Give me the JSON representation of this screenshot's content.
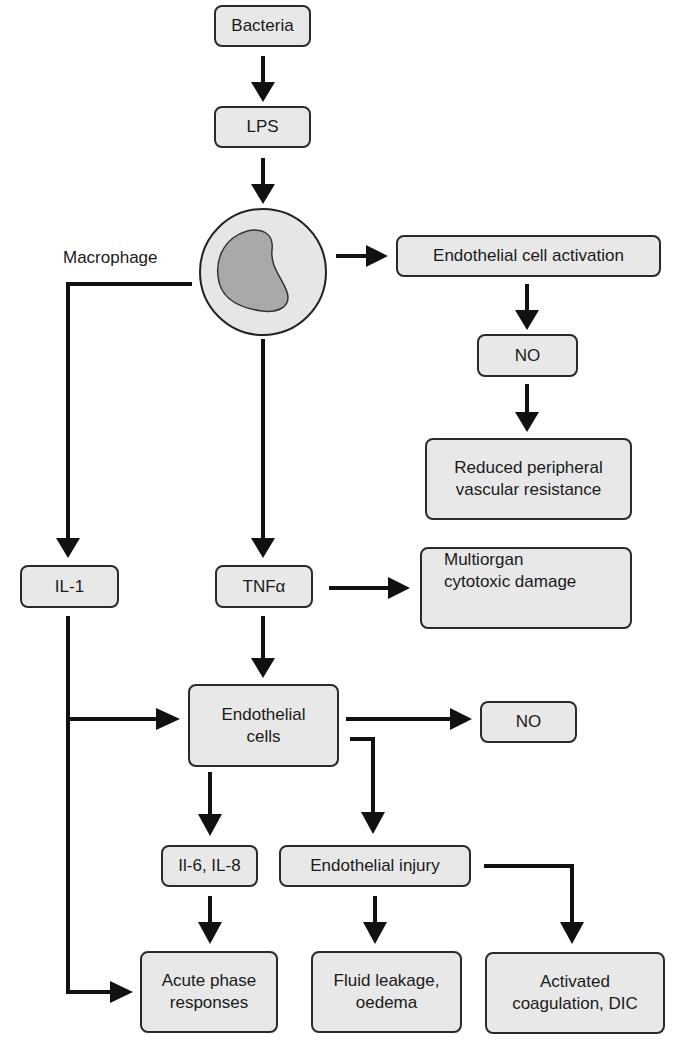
{
  "diagram": {
    "title": "",
    "colors": {
      "box_fill": "#e8e8e8",
      "stroke": "#1a1a1a",
      "cell_outer": "#e6e6e6",
      "cell_nucleus": "#a9a9a9"
    },
    "nodes": {
      "bacteria": "Bacteria",
      "lps": "LPS",
      "macrophage": "Macrophage",
      "endothelial_activation": "Endothelial cell activation",
      "no_top": "NO",
      "reduced_pvr_l1": "Reduced peripheral",
      "reduced_pvr_l2": "vascular resistance",
      "il1": "IL-1",
      "tnfa": "TNFα",
      "multiorgan_l1": "Multiorgan",
      "multiorgan_l2": "cytotoxic damage",
      "endothelial_cells_l1": "Endothelial",
      "endothelial_cells_l2": "cells",
      "no_mid": "NO",
      "il6_il8": "Il-6, IL-8",
      "endothelial_injury": "Endothelial injury",
      "acute_phase_l1": "Acute phase",
      "acute_phase_l2": "responses",
      "fluid_leakage_l1": "Fluid leakage,",
      "fluid_leakage_l2": "oedema",
      "coagulation_l1": "Activated",
      "coagulation_l2": "coagulation, DIC"
    },
    "edges": [
      [
        "Bacteria",
        "LPS"
      ],
      [
        "LPS",
        "Macrophage"
      ],
      [
        "Macrophage",
        "Endothelial cell activation"
      ],
      [
        "Endothelial cell activation",
        "NO"
      ],
      [
        "NO",
        "Reduced peripheral vascular resistance"
      ],
      [
        "Macrophage",
        "IL-1"
      ],
      [
        "Macrophage",
        "TNFα"
      ],
      [
        "TNFα",
        "Multiorgan cytotoxic damage"
      ],
      [
        "TNFα",
        "Endothelial cells"
      ],
      [
        "IL-1",
        "Endothelial cells"
      ],
      [
        "IL-1",
        "Acute phase responses"
      ],
      [
        "Endothelial cells",
        "NO"
      ],
      [
        "Endothelial cells",
        "Il-6, IL-8"
      ],
      [
        "Endothelial cells",
        "Endothelial injury"
      ],
      [
        "Il-6, IL-8",
        "Acute phase responses"
      ],
      [
        "Endothelial injury",
        "Fluid leakage, oedema"
      ],
      [
        "Endothelial injury",
        "Activated coagulation, DIC"
      ]
    ]
  }
}
